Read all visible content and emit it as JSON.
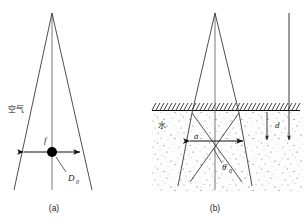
{
  "figure": {
    "type": "two-panel-schematic",
    "background_color": "#ffffff",
    "line_color": "#3a3a3a",
    "accent_color": "#000000"
  },
  "panel_a": {
    "caption": "(a)",
    "medium_label": "空气",
    "focus_label": "f",
    "aperture_label": "D",
    "aperture_sub": "0",
    "description": "converging beam cone in air focusing to a point"
  },
  "panel_b": {
    "caption": "(b)",
    "medium_label": "水",
    "depth_label": "d",
    "angle_label": "θ",
    "angle_sub": "0",
    "width_label": "a",
    "description": "converging beam cone refracted at water surface, focus shifted deeper"
  }
}
